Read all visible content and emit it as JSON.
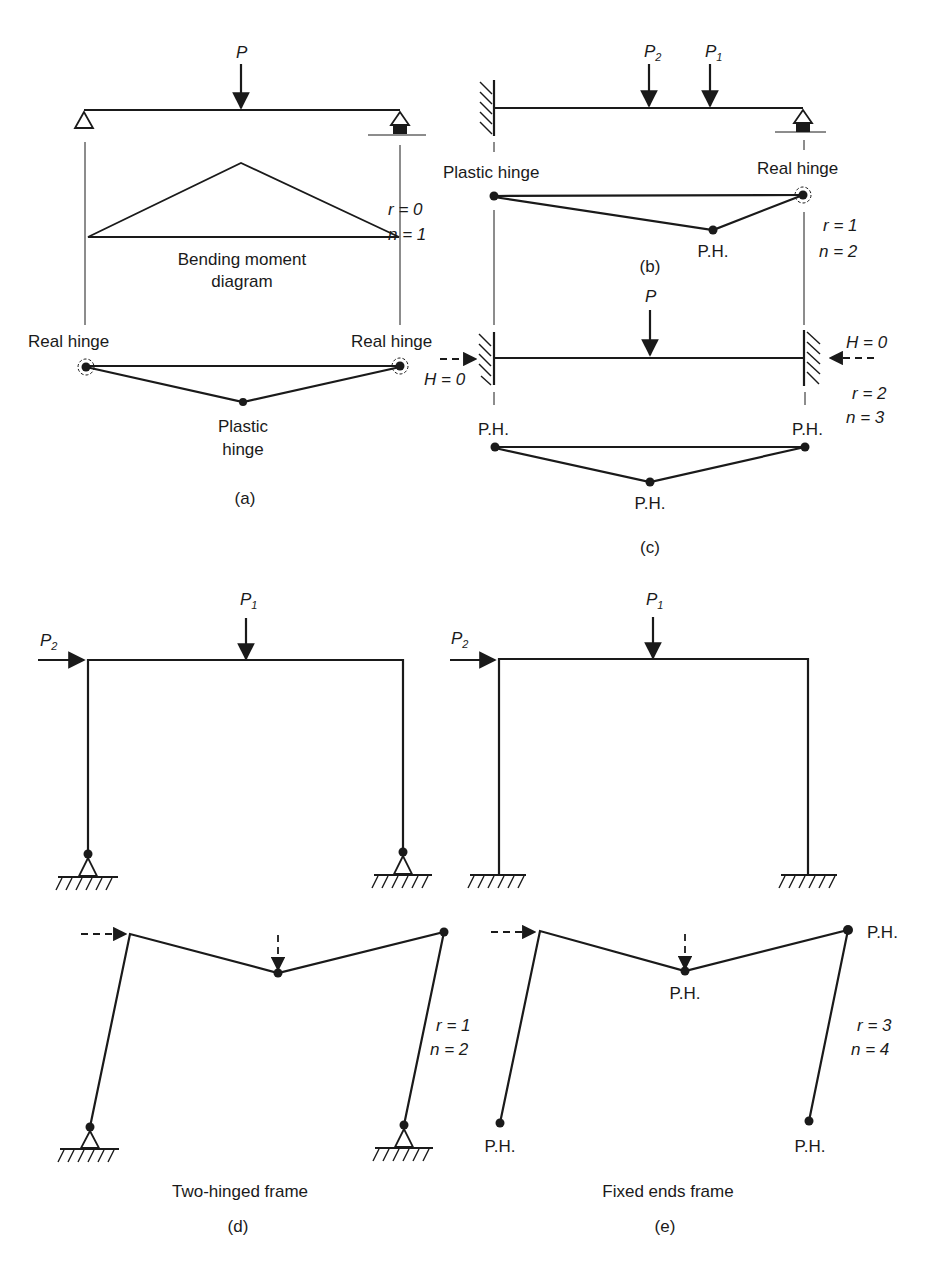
{
  "colors": {
    "ink": "#1a1a1a",
    "background": "#ffffff"
  },
  "panel_a": {
    "caption": "(a)",
    "load_label": "P",
    "bm_label_line1": "Bending moment",
    "bm_label_line2": "diagram",
    "left_hinge_label": "Real hinge",
    "right_hinge_label": "Real hinge",
    "plastic_label_line1": "Plastic",
    "plastic_label_line2": "hinge",
    "r_label": "r = 0",
    "n_label": "n = 1"
  },
  "panel_b": {
    "caption": "(b)",
    "load2_label": "P",
    "load2_sub": "2",
    "load1_label": "P",
    "load1_sub": "1",
    "left_label": "Plastic hinge",
    "right_label": "Real hinge",
    "mid_label": "P.H.",
    "r_label": "r = 1",
    "n_label": "n = 2"
  },
  "panel_c": {
    "caption": "(c)",
    "load_label": "P",
    "left_h_label": "H = 0",
    "right_h_label": "H = 0",
    "left_ph": "P.H.",
    "right_ph": "P.H.",
    "mid_ph": "P.H.",
    "r_label": "r = 2",
    "n_label": "n = 3"
  },
  "panel_d": {
    "caption": "(d)",
    "title": "Two-hinged frame",
    "load1_label": "P",
    "load1_sub": "1",
    "load2_label": "P",
    "load2_sub": "2",
    "r_label": "r = 1",
    "n_label": "n = 2"
  },
  "panel_e": {
    "caption": "(e)",
    "title": "Fixed ends frame",
    "load1_label": "P",
    "load1_sub": "1",
    "load2_label": "P",
    "load2_sub": "2",
    "top_right_ph": "P.H.",
    "mid_ph": "P.H.",
    "bottom_left_ph": "P.H.",
    "bottom_right_ph": "P.H.",
    "r_label": "r = 3",
    "n_label": "n = 4"
  }
}
